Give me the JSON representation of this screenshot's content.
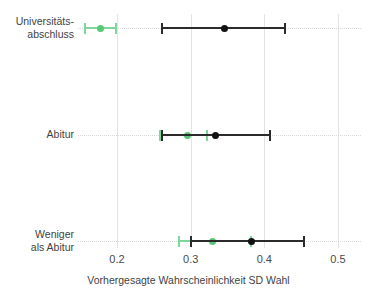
{
  "chart_data": {
    "type": "scatter",
    "title": "",
    "subtitle": "",
    "xlabel": "Vorhergesagte Wahrscheinlichkeit SD Wahl",
    "ylabel": "",
    "xlim": [
      0.148,
      0.512
    ],
    "xticks": [
      0.2,
      0.3,
      0.4,
      0.5
    ],
    "xticklabels": [
      "0.2",
      "0.3",
      "0.4",
      "0.5"
    ],
    "categories": [
      "Universitäts-\nabschluss",
      "Abitur",
      "Weniger\nals Abitur"
    ],
    "grid": "both",
    "legend": "none",
    "orientation": "horizontal",
    "colors": {
      "series_green": "#7fd69a",
      "series_green_point": "#56c878",
      "series_black": "#2b2b2b",
      "series_black_point": "#121212",
      "gridline": "#e3e3e3",
      "background": "#ffffff",
      "text": "#3f3f3f"
    },
    "series": [
      {
        "name": "green",
        "color": "#7fd69a",
        "points": [
          {
            "category": "Universitäts-\nabschluss",
            "estimate": 0.178,
            "low": 0.155,
            "high": 0.2
          },
          {
            "category": "Abitur",
            "estimate": 0.296,
            "low": 0.257,
            "high": 0.323
          },
          {
            "category": "Weniger\nals Abitur",
            "estimate": 0.33,
            "low": 0.283,
            "high": 0.383
          }
        ]
      },
      {
        "name": "black",
        "color": "#2b2b2b",
        "points": [
          {
            "category": "Universitäts-\nabschluss",
            "estimate": 0.346,
            "low": 0.26,
            "high": 0.43
          },
          {
            "category": "Abitur",
            "estimate": 0.334,
            "low": 0.26,
            "high": 0.409
          },
          {
            "category": "Weniger\nals Abitur",
            "estimate": 0.383,
            "low": 0.299,
            "high": 0.455
          }
        ]
      }
    ]
  },
  "axis": {
    "x_title": "Vorhergesagte Wahrscheinlichkeit SD Wahl",
    "tick_0": "0.2",
    "tick_1": "0.3",
    "tick_2": "0.4",
    "tick_3": "0.5"
  },
  "rows": [
    {
      "label": "Universitäts-\nabschluss"
    },
    {
      "label": "Abitur"
    },
    {
      "label": "Weniger\nals Abitur"
    }
  ]
}
